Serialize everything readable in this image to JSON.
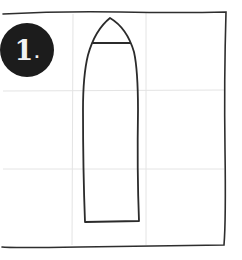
{
  "step": {
    "number": "1",
    "suffix": "."
  },
  "sketch": {
    "subject": "bullet-shaped outline",
    "stroke_color": "#2b2b2b",
    "guide_color": "#e2e2e2",
    "badge_color": "#1c1c1c"
  }
}
